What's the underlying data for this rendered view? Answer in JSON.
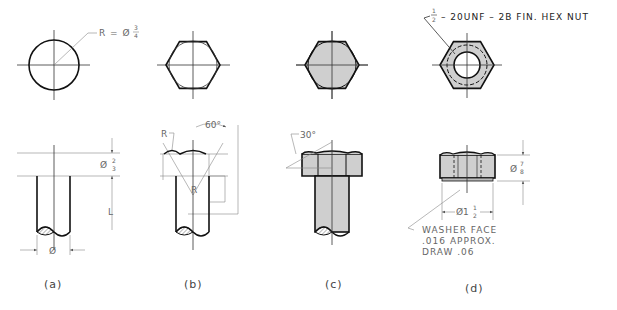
{
  "figure": {
    "panels": [
      {
        "id": "a",
        "caption": "(a)",
        "top_view_note": "R = Ø",
        "top_view_fraction_num": "3",
        "top_view_fraction_den": "4",
        "head_height_label": "Ø",
        "head_height_num": "2",
        "head_height_den": "3",
        "length_label": "L",
        "shank_diameter_label": "Ø"
      },
      {
        "id": "b",
        "caption": "(b)",
        "radius_label": "R",
        "inner_radius_label": "R",
        "angle_label": "60°"
      },
      {
        "id": "c",
        "caption": "(c)",
        "angle_label": "30°"
      },
      {
        "id": "d",
        "caption": "(d)",
        "nut_callout_num": "1",
        "nut_callout_den": "2",
        "nut_callout_text": "– 20UNF – 2B FIN. HEX NUT",
        "thickness_label": "Ø",
        "thickness_num": "7",
        "thickness_den": "8",
        "across_flats_label": "Ø1",
        "across_flats_num": "1",
        "across_flats_den": "2",
        "washer_note_line1": "WASHER FACE",
        "washer_note_line2": ".016 APPROX.",
        "washer_note_line3": "DRAW .06"
      }
    ]
  },
  "colors": {
    "line": "#111111",
    "construction": "#888888",
    "shade": "#cfcfcf",
    "text": "#555555"
  }
}
